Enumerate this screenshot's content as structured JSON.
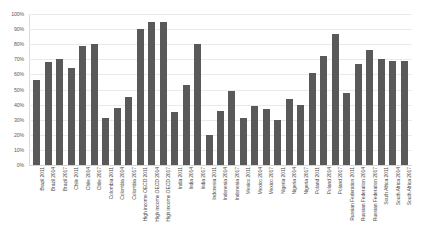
{
  "chart_data": {
    "type": "bar",
    "title": "",
    "subtitle": "",
    "xlabel": "",
    "ylabel": "",
    "ylim": [
      0,
      100
    ],
    "y_unit": "%",
    "grid": true,
    "legend": false,
    "bar_color": "#595959",
    "gridline_color": "#eaeaea",
    "background_color": "#ffffff",
    "y_ticks": [
      "0%",
      "10%",
      "20%",
      "30%",
      "40%",
      "50%",
      "60%",
      "70%",
      "80%",
      "90%",
      "100%"
    ],
    "y_tick_values": [
      0,
      10,
      20,
      30,
      40,
      50,
      60,
      70,
      80,
      90,
      100
    ],
    "categories": [
      "Brazil 2011",
      "Brazil 2014",
      "Brazil 2017",
      "Chile 2011",
      "Chile 2014",
      "Chile 2017",
      "Colombia 2011",
      "Colombia 2014",
      "Colombia 2017",
      "High income OECD 2011",
      "High income OECD 2014",
      "High income OECD 2017",
      "India 2011",
      "India 2014",
      "India 2017",
      "Indonesia 2011",
      "Indonesia 2014",
      "Indonesia 2017",
      "Mexico 2011",
      "Mexico 2014",
      "Mexico 2017",
      "Nigeria 2011",
      "Nigeria 2014",
      "Nigeria 2017",
      "Poland 2011",
      "Poland 2014",
      "Poland 2017",
      "Russian Federation 2011",
      "Russian Federation 2014",
      "Russian Federation 2017",
      "South Africa 2011",
      "South Africa 2014",
      "South Africa 2017"
    ],
    "values": [
      56,
      68,
      70,
      64,
      79,
      80,
      31,
      38,
      45,
      90,
      95,
      95,
      35,
      53,
      80,
      20,
      36,
      49,
      31,
      39,
      37,
      30,
      44,
      40,
      61,
      72,
      87,
      48,
      67,
      76,
      70,
      69,
      69
    ]
  }
}
